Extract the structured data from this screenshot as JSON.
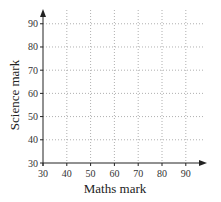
{
  "chart_data": {
    "type": "scatter",
    "title": "",
    "xlabel": "Maths mark",
    "ylabel": "Science mark",
    "xlim": [
      30,
      95
    ],
    "ylim": [
      30,
      95
    ],
    "x_ticks": [
      30,
      40,
      50,
      60,
      70,
      80,
      90
    ],
    "y_ticks": [
      30,
      40,
      50,
      60,
      70,
      80,
      90
    ],
    "x_tick_labels": [
      "30",
      "40",
      "50",
      "60",
      "70",
      "80",
      "90"
    ],
    "y_tick_labels": [
      "30",
      "40",
      "50",
      "60",
      "70",
      "80",
      "90"
    ],
    "grid": true,
    "grid_style": "dotted",
    "series": [],
    "points": [],
    "legend": null
  },
  "colors": {
    "axis": "#222222",
    "grid": "#9a9a9a",
    "text": "#333333"
  }
}
